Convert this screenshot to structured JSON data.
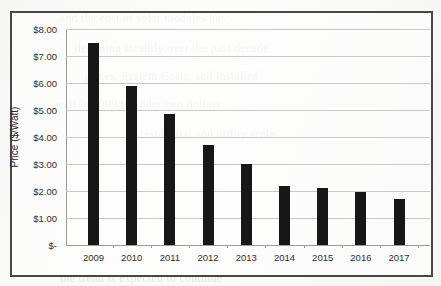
{
  "chart_data": {
    "type": "bar",
    "title": "",
    "subtitle": "",
    "xlabel": "",
    "ylabel": "Price ($/Watt)",
    "categories": [
      "2009",
      "2010",
      "2011",
      "2012",
      "2013",
      "2014",
      "2015",
      "2016",
      "2017"
    ],
    "values": [
      7.5,
      5.9,
      4.85,
      3.7,
      3.0,
      2.2,
      2.1,
      1.95,
      1.7
    ],
    "series": [
      {
        "name": "Price ($/Watt)",
        "values": [
          7.5,
          5.9,
          4.85,
          3.7,
          3.0,
          2.2,
          2.1,
          1.95,
          1.7
        ]
      }
    ],
    "ylim": [
      0,
      8
    ],
    "ytick_values": [
      0,
      1,
      2,
      3,
      4,
      5,
      6,
      7,
      8
    ],
    "ytick_labels": [
      "$-",
      "$1.00",
      "$2.00",
      "$3.00",
      "$4.00",
      "$5.00",
      "$6.00",
      "$7.00",
      "$8.00"
    ],
    "grid": "horizontal",
    "legend": "none",
    "bar_color": "#171717",
    "gridline_color": "#c8c8c8",
    "axis_color": "#9a9a9a",
    "frame_color": "#474747"
  },
  "background_text": {
    "lines": [
      "and the cost of solar modules has",
      "declining steadily over the past decade",
      "prices, System Costs, and installed",
      "watt in 2009 to under two dollars",
      "residential and utility scale",
      "the trend is expected to continue"
    ]
  }
}
